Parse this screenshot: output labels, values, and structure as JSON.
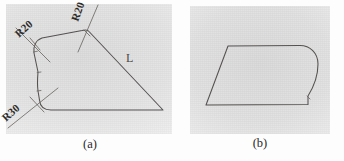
{
  "figure": {
    "kind": "engineering-drawing-scan",
    "ink_color": "#555150",
    "paper_color": "#e3e3e3",
    "panels": [
      {
        "id": "a",
        "caption": "(a)",
        "description": "Closed outline with three filleted corners and an L reference mark",
        "annotations": [
          {
            "name": "fillet-upper-left",
            "label": "R20"
          },
          {
            "name": "fillet-top",
            "label": "R20"
          },
          {
            "name": "fillet-lower-left",
            "label": "R30"
          },
          {
            "name": "reference-mark",
            "label": "L"
          }
        ]
      },
      {
        "id": "b",
        "caption": "(b)",
        "description": "Parallelogram outline with the right-hand edge rounded",
        "annotations": []
      }
    ]
  },
  "labels": {
    "r20_upper_left": "R20",
    "r20_top": "R20",
    "r30_lower_left": "R30",
    "l_mark": "L",
    "caption_a": "(a)",
    "caption_b": "(b)"
  }
}
